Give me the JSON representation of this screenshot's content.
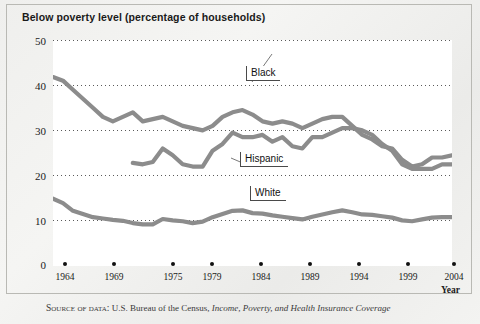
{
  "figure": {
    "title": "Below poverty level (percentage of households)",
    "source_prefix": "Source of data:",
    "source_agency": "U.S. Bureau of the Census,",
    "source_publication": "Income, Poverty, and Health Insurance Coverage"
  },
  "chart_data": {
    "type": "line",
    "title": "Below poverty level (percentage of households)",
    "xlabel": "Year",
    "ylabel": "",
    "xlim": [
      1964,
      2004
    ],
    "ylim": [
      0,
      50
    ],
    "yticks": [
      0,
      10,
      20,
      30,
      40,
      50
    ],
    "xticks": [
      1964,
      1969,
      1975,
      1979,
      1984,
      1989,
      1994,
      1999,
      2004
    ],
    "grid": "horizontal-dotted",
    "legend": "inline-callout-labels",
    "line_color": "#8c8c8c",
    "series": [
      {
        "name": "Black",
        "label": "Black",
        "x": [
          1964,
          1965,
          1966,
          1967,
          1968,
          1969,
          1970,
          1971,
          1972,
          1973,
          1974,
          1975,
          1976,
          1977,
          1978,
          1979,
          1980,
          1981,
          1982,
          1983,
          1984,
          1985,
          1986,
          1987,
          1988,
          1989,
          1990,
          1991,
          1992,
          1993,
          1994,
          1995,
          1996,
          1997,
          1998,
          1999,
          2000,
          2001,
          2002,
          2003,
          2004
        ],
        "values": [
          41.8,
          41.0,
          39.0,
          37.0,
          35.0,
          33.0,
          32.0,
          33.0,
          34.0,
          32.0,
          32.5,
          33.0,
          32.0,
          31.0,
          30.5,
          30.0,
          31.0,
          33.0,
          34.0,
          34.5,
          33.5,
          32.0,
          31.5,
          32.0,
          31.5,
          30.5,
          31.5,
          32.5,
          33.0,
          33.0,
          31.0,
          29.0,
          28.0,
          26.5,
          26.0,
          23.5,
          22.0,
          22.5,
          24.0,
          24.0,
          24.5
        ]
      },
      {
        "name": "Hispanic",
        "label": "Hispanic",
        "x": [
          1972,
          1973,
          1974,
          1975,
          1976,
          1977,
          1978,
          1979,
          1980,
          1981,
          1982,
          1983,
          1984,
          1985,
          1986,
          1987,
          1988,
          1989,
          1990,
          1991,
          1992,
          1993,
          1994,
          1995,
          1996,
          1997,
          1998,
          1999,
          2000,
          2001,
          2002,
          2003,
          2004
        ],
        "values": [
          22.8,
          22.5,
          23.0,
          26.0,
          24.5,
          22.5,
          22.0,
          22.0,
          25.5,
          27.0,
          29.5,
          28.5,
          28.5,
          29.0,
          27.5,
          28.5,
          26.5,
          26.0,
          28.5,
          28.5,
          29.5,
          30.5,
          30.5,
          30.0,
          29.0,
          27.0,
          25.5,
          22.5,
          21.5,
          21.5,
          21.5,
          22.5,
          22.5
        ]
      },
      {
        "name": "White",
        "label": "White",
        "x": [
          1964,
          1965,
          1966,
          1967,
          1968,
          1969,
          1970,
          1971,
          1972,
          1973,
          1974,
          1975,
          1976,
          1977,
          1978,
          1979,
          1980,
          1981,
          1982,
          1983,
          1984,
          1985,
          1986,
          1987,
          1988,
          1989,
          1990,
          1991,
          1992,
          1993,
          1994,
          1995,
          1996,
          1997,
          1998,
          1999,
          2000,
          2001,
          2002,
          2003,
          2004
        ],
        "values": [
          14.9,
          13.9,
          12.2,
          11.5,
          10.8,
          10.5,
          10.2,
          10.0,
          9.5,
          9.2,
          9.2,
          10.4,
          10.1,
          9.9,
          9.5,
          9.8,
          10.8,
          11.5,
          12.2,
          12.3,
          11.7,
          11.6,
          11.2,
          10.9,
          10.6,
          10.3,
          10.9,
          11.4,
          11.9,
          12.3,
          11.9,
          11.4,
          11.3,
          11.0,
          10.7,
          10.1,
          9.9,
          10.3,
          10.7,
          10.8,
          10.8
        ]
      }
    ]
  },
  "axes": {
    "yticks": [
      {
        "label": "50",
        "value": 50
      },
      {
        "label": "40",
        "value": 40
      },
      {
        "label": "30",
        "value": 30
      },
      {
        "label": "20",
        "value": 20
      },
      {
        "label": "10",
        "value": 10
      },
      {
        "label": "0",
        "value": 0
      }
    ],
    "xticks": [
      {
        "label": "1964",
        "value": 1964
      },
      {
        "label": "1969",
        "value": 1969
      },
      {
        "label": "1975",
        "value": 1975
      },
      {
        "label": "1979",
        "value": 1979
      },
      {
        "label": "1984",
        "value": 1984
      },
      {
        "label": "1989",
        "value": 1989
      },
      {
        "label": "1994",
        "value": 1994
      },
      {
        "label": "1999",
        "value": 1999
      },
      {
        "label": "2004",
        "value": 2004
      }
    ],
    "xaxis_label": "Year"
  }
}
